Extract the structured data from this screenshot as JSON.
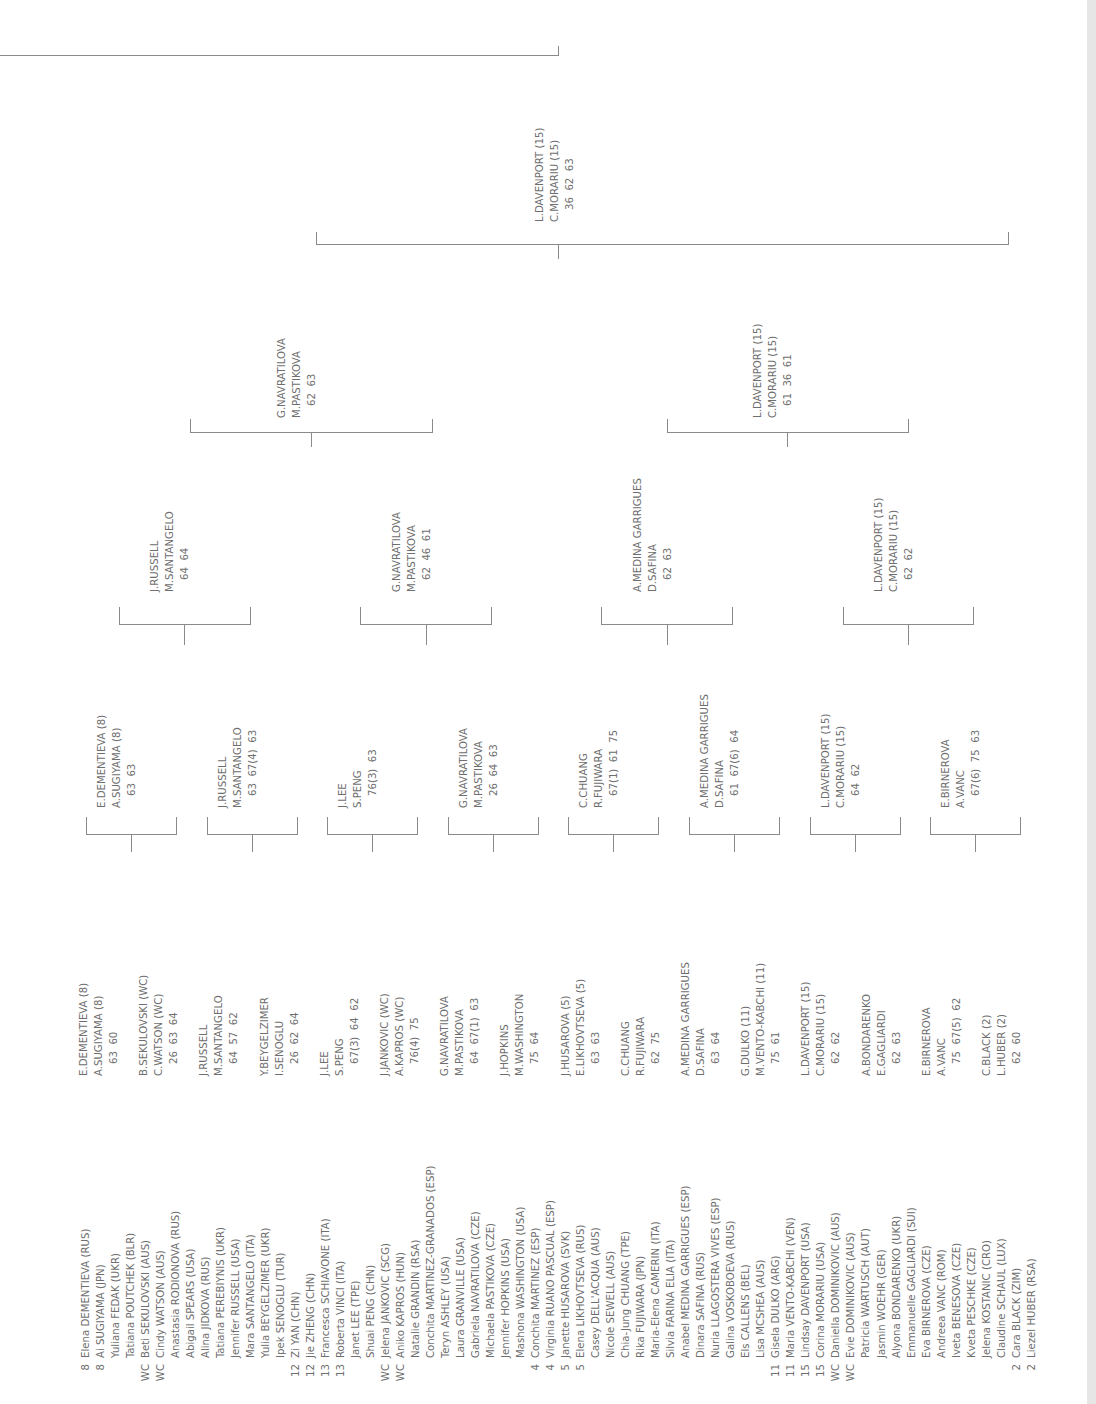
{
  "draw": {
    "entries": [
      {
        "seed": "8",
        "name": "Elena DEMENTIEVA (RUS)"
      },
      {
        "seed": "8",
        "name": "Ai SUGIYAMA (JPN)"
      },
      {
        "seed": "",
        "name": "Yuliana FEDAK (UKR)"
      },
      {
        "seed": "",
        "name": "Tatiana POUTCHEK (BLR)"
      },
      {
        "seed": "WC",
        "name": "Beti SEKULOVSKI (AUS)"
      },
      {
        "seed": "WC",
        "name": "Cindy WATSON (AUS)"
      },
      {
        "seed": "",
        "name": "Anastasia RODIONOVA (RUS)"
      },
      {
        "seed": "",
        "name": "Abigail SPEARS (USA)"
      },
      {
        "seed": "",
        "name": "Alina JIDKOVA (RUS)"
      },
      {
        "seed": "",
        "name": "Tatiana PEREBIYNIS (UKR)"
      },
      {
        "seed": "",
        "name": "Jennifer RUSSELL (USA)"
      },
      {
        "seed": "",
        "name": "Mara SANTANGELO (ITA)"
      },
      {
        "seed": "",
        "name": "Yulia BEYGELZIMER (UKR)"
      },
      {
        "seed": "",
        "name": "Ipek SENOGLU (TUR)"
      },
      {
        "seed": "12",
        "name": "Zi YAN (CHN)"
      },
      {
        "seed": "12",
        "name": "Jie ZHENG (CHN)"
      },
      {
        "seed": "13",
        "name": "Francesca SCHIAVONE (ITA)"
      },
      {
        "seed": "13",
        "name": "Roberta VINCI (ITA)"
      },
      {
        "seed": "",
        "name": "Janet LEE (TPE)"
      },
      {
        "seed": "",
        "name": "Shuai PENG (CHN)"
      },
      {
        "seed": "WC",
        "name": "Jelena JANKOVIC (SCG)"
      },
      {
        "seed": "WC",
        "name": "Aniko KAPROS (HUN)"
      },
      {
        "seed": "",
        "name": "Natalie GRANDIN (RSA)"
      },
      {
        "seed": "",
        "name": "Conchita MARTINEZ-GRANADOS (ESP)"
      },
      {
        "seed": "",
        "name": "Teryn ASHLEY (USA)"
      },
      {
        "seed": "",
        "name": "Laura GRANVILLE (USA)"
      },
      {
        "seed": "",
        "name": "Gabriela NAVRATILOVA (CZE)"
      },
      {
        "seed": "",
        "name": "Michaela PASTIKOVA (CZE)"
      },
      {
        "seed": "",
        "name": "Jennifer HOPKINS (USA)"
      },
      {
        "seed": "",
        "name": "Mashona WASHINGTON (USA)"
      },
      {
        "seed": "4",
        "name": "Conchita MARTINEZ (ESP)"
      },
      {
        "seed": "4",
        "name": "Virginia RUANO PASCUAL (ESP)"
      },
      {
        "seed": "5",
        "name": "Janette HUSAROVA (SVK)"
      },
      {
        "seed": "5",
        "name": "Elena LIKHOVTSEVA (RUS)"
      },
      {
        "seed": "",
        "name": "Casey DELL'ACQUA (AUS)"
      },
      {
        "seed": "",
        "name": "Nicole SEWELL (AUS)"
      },
      {
        "seed": "",
        "name": "Chia-Jung CHUANG (TPE)"
      },
      {
        "seed": "",
        "name": "Rika FUJIWARA (JPN)"
      },
      {
        "seed": "",
        "name": "Maria-Elena CAMERIN (ITA)"
      },
      {
        "seed": "",
        "name": "Silvia FARINA ELIA (ITA)"
      },
      {
        "seed": "",
        "name": "Anabel MEDINA GARRIGUES (ESP)"
      },
      {
        "seed": "",
        "name": "Dinara SAFINA (RUS)"
      },
      {
        "seed": "",
        "name": "Nuria LLAGOSTERA VIVES (ESP)"
      },
      {
        "seed": "",
        "name": "Galina VOSKOBOEVA (RUS)"
      },
      {
        "seed": "",
        "name": "Els CALLENS (BEL)"
      },
      {
        "seed": "",
        "name": "Lisa MCSHEA (AUS)"
      },
      {
        "seed": "11",
        "name": "Gisela DULKO (ARG)"
      },
      {
        "seed": "11",
        "name": "Maria VENTO-KABCHI (VEN)"
      },
      {
        "seed": "15",
        "name": "Lindsay DAVENPORT (USA)"
      },
      {
        "seed": "15",
        "name": "Corina MORARIU (USA)"
      },
      {
        "seed": "WC",
        "name": "Daniella DOMINIKOVIC (AUS)"
      },
      {
        "seed": "WC",
        "name": "Evie DOMINIKOVIC (AUS)"
      },
      {
        "seed": "",
        "name": "Patricia WARTUSCH (AUT)"
      },
      {
        "seed": "",
        "name": "Jasmin WOEHR (GER)"
      },
      {
        "seed": "",
        "name": "Alyona BONDARENKO (UKR)"
      },
      {
        "seed": "",
        "name": "Emmanuelle GAGLIARDI (SUI)"
      },
      {
        "seed": "",
        "name": "Eva BIRNEROVA (CZE)"
      },
      {
        "seed": "",
        "name": "Andreea VANC (ROM)"
      },
      {
        "seed": "",
        "name": "Iveta BENESOVA (CZE)"
      },
      {
        "seed": "",
        "name": "Kveta PESCHKE (CZE)"
      },
      {
        "seed": "",
        "name": "Jelena KOSTANIC (CRO)"
      },
      {
        "seed": "",
        "name": "Claudine SCHAUL (LUX)"
      },
      {
        "seed": "2",
        "name": "Cara BLACK (ZIM)"
      },
      {
        "seed": "2",
        "name": "Liezel HUBER (RSA)"
      }
    ]
  },
  "round1": [
    {
      "p1": "E.DEMENTIEVA (8)",
      "p2": "A.SUGIYAMA (8)",
      "score": "63  60"
    },
    {
      "p1": "B.SEKULOVSKI (WC)",
      "p2": "C.WATSON (WC)",
      "score": "26  63  64"
    },
    {
      "p1": "J.RUSSELL",
      "p2": "M.SANTANGELO",
      "score": "64  57  62"
    },
    {
      "p1": "Y.BEYGELZIMER",
      "p2": "I.SENOGLU",
      "score": "26  62  64"
    },
    {
      "p1": "J.LEE",
      "p2": "S.PENG",
      "score": "67(3)  64  62"
    },
    {
      "p1": "J.JANKOVIC (WC)",
      "p2": "A.KAPROS (WC)",
      "score": "76(4)  75"
    },
    {
      "p1": "G.NAVRATILOVA",
      "p2": "M.PASTIKOVA",
      "score": "64  67(1)  63"
    },
    {
      "p1": "J.HOPKINS",
      "p2": "M.WASHINGTON",
      "score": "75  64"
    },
    {
      "p1": "J.HUSAROVA (5)",
      "p2": "E.LIKHOVTSEVA (5)",
      "score": "63  63"
    },
    {
      "p1": "C.CHUANG",
      "p2": "R.FUJIWARA",
      "score": "62  75"
    },
    {
      "p1": "A.MEDINA GARRIGUES",
      "p2": "D.SAFINA",
      "score": "63  64"
    },
    {
      "p1": "G.DULKO (11)",
      "p2": "M.VENTO-KABCHI (11)",
      "score": "75  61"
    },
    {
      "p1": "L.DAVENPORT (15)",
      "p2": "C.MORARIU (15)",
      "score": "62  62"
    },
    {
      "p1": "A.BONDARENKO",
      "p2": "E.GAGLIARDI",
      "score": "62  63"
    },
    {
      "p1": "E.BIRNEROVA",
      "p2": "A.VANC",
      "score": "75  67(5)  62"
    },
    {
      "p1": "C.BLACK (2)",
      "p2": "L.HUBER (2)",
      "score": "62  60"
    }
  ],
  "round2": [
    {
      "p1": "E.DEMENTIEVA (8)",
      "p2": "A.SUGIYAMA (8)",
      "score": "63  63"
    },
    {
      "p1": "J.RUSSELL",
      "p2": "M.SANTANGELO",
      "score": "63  67(4)  63"
    },
    {
      "p1": "J.LEE",
      "p2": "S.PENG",
      "score": "76(3)  63"
    },
    {
      "p1": "G.NAVRATILOVA",
      "p2": "M.PASTIKOVA",
      "score": "26  64  63"
    },
    {
      "p1": "C.CHUANG",
      "p2": "R.FUJIWARA",
      "score": "67(1)  61  75"
    },
    {
      "p1": "A.MEDINA GARRIGUES",
      "p2": "D.SAFINA",
      "score": "61  67(6)  64"
    },
    {
      "p1": "L.DAVENPORT (15)",
      "p2": "C.MORARIU (15)",
      "score": "64  62"
    },
    {
      "p1": "E.BIRNEROVA",
      "p2": "A.VANC",
      "score": "67(6)  75  63"
    }
  ],
  "quarterfinals": [
    {
      "p1": "J.RUSSELL",
      "p2": "M.SANTANGELO",
      "score": "64  64"
    },
    {
      "p1": "G.NAVRATILOVA",
      "p2": "M.PASTIKOVA",
      "score": "62  46  61"
    },
    {
      "p1": "A.MEDINA GARRIGUES",
      "p2": "D.SAFINA",
      "score": "62  63"
    },
    {
      "p1": "L.DAVENPORT (15)",
      "p2": "C.MORARIU (15)",
      "score": "62  62"
    }
  ],
  "semifinals": [
    {
      "p1": "G.NAVRATILOVA",
      "p2": "M.PASTIKOVA",
      "score": "62  63"
    },
    {
      "p1": "L.DAVENPORT (15)",
      "p2": "C.MORARIU (15)",
      "score": "61  36  61"
    }
  ],
  "final": {
    "p1": "L.DAVENPORT (15)",
    "p2": "C.MORARIU (15)",
    "score": "36  62  63"
  },
  "colors": {
    "text": "#6e6e6e",
    "line": "#8a8a8a",
    "edge": "#e6e6e6"
  }
}
